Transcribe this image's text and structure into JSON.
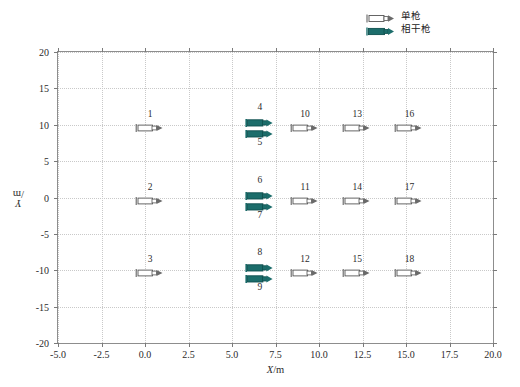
{
  "chart_data": {
    "type": "scatter",
    "title": "",
    "xlabel": "X/m",
    "ylabel": "Y/m",
    "xlim": [
      -5.0,
      20.0
    ],
    "ylim": [
      -20,
      20
    ],
    "xticks": [
      "-5.0",
      "-2.5",
      "0.0",
      "2.5",
      "5.0",
      "7.5",
      "10.0",
      "12.5",
      "15.0",
      "17.5",
      "20.0"
    ],
    "xtick_values": [
      -5.0,
      -2.5,
      0.0,
      2.5,
      5.0,
      7.5,
      10.0,
      12.5,
      15.0,
      17.5,
      20.0
    ],
    "yticks": [
      "-20",
      "-15",
      "-10",
      "-5",
      "0",
      "5",
      "10",
      "15",
      "20"
    ],
    "ytick_values": [
      -20,
      -15,
      -10,
      -5,
      0,
      5,
      10,
      15,
      20
    ],
    "grid": true,
    "legend_position": "above-right",
    "series": [
      {
        "name": "单枪",
        "marker": "open-gun-arrow",
        "color": "#ffffff",
        "edge_color": "#555555",
        "points": [
          {
            "label": "1",
            "x": 0.3,
            "y": 10,
            "label_pos": "above"
          },
          {
            "label": "2",
            "x": 0.3,
            "y": 0,
            "label_pos": "above"
          },
          {
            "label": "3",
            "x": 0.3,
            "y": -10,
            "label_pos": "above"
          },
          {
            "label": "10",
            "x": 9.2,
            "y": 10,
            "label_pos": "above"
          },
          {
            "label": "11",
            "x": 9.2,
            "y": 0,
            "label_pos": "above"
          },
          {
            "label": "12",
            "x": 9.2,
            "y": -10,
            "label_pos": "above"
          },
          {
            "label": "13",
            "x": 12.2,
            "y": 10,
            "label_pos": "above"
          },
          {
            "label": "14",
            "x": 12.2,
            "y": 0,
            "label_pos": "above"
          },
          {
            "label": "15",
            "x": 12.2,
            "y": -10,
            "label_pos": "above"
          },
          {
            "label": "16",
            "x": 15.2,
            "y": 10,
            "label_pos": "above"
          },
          {
            "label": "17",
            "x": 15.2,
            "y": 0,
            "label_pos": "above"
          },
          {
            "label": "18",
            "x": 15.2,
            "y": -10,
            "label_pos": "above"
          }
        ]
      },
      {
        "name": "相干枪",
        "marker": "filled-gun-arrow",
        "color": "#1c6d6b",
        "edge_color": "#0f4f4e",
        "points": [
          {
            "label": "4",
            "x": 6.6,
            "y": 10,
            "label_pos": "above"
          },
          {
            "label": "5",
            "x": 6.6,
            "y": 10,
            "label_pos": "below"
          },
          {
            "label": "6",
            "x": 6.6,
            "y": 0,
            "label_pos": "above"
          },
          {
            "label": "7",
            "x": 6.6,
            "y": 0,
            "label_pos": "below"
          },
          {
            "label": "8",
            "x": 6.6,
            "y": -10,
            "label_pos": "above"
          },
          {
            "label": "9",
            "x": 6.6,
            "y": -10,
            "label_pos": "below"
          }
        ]
      }
    ]
  },
  "legend": {
    "entries": [
      {
        "label": "单枪",
        "swatch": "open-gun-arrow-icon",
        "color": "#ffffff"
      },
      {
        "label": "相干枪",
        "swatch": "filled-gun-arrow-icon",
        "color": "#1c6d6b"
      }
    ]
  },
  "axis": {
    "xlabel_var": "X",
    "xlabel_unit": "/m",
    "ylabel_var": "Y",
    "ylabel_unit": "/m"
  },
  "colors": {
    "accent_teal": "#1c6d6b",
    "grid": "#c9c9c9",
    "frame": "#8d8d8d",
    "text": "#2b2b2b"
  },
  "caption_sliver": ""
}
